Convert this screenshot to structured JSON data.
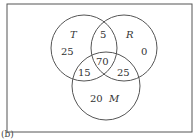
{
  "diagram": {
    "type": "venn",
    "caption": "(b)",
    "sets": {
      "T": {
        "label": "T",
        "only": "25"
      },
      "R": {
        "label": "R",
        "only": "0"
      },
      "M": {
        "label": "M",
        "only": "20"
      }
    },
    "regions": {
      "T_R": "5",
      "T_M": "15",
      "R_M": "25",
      "T_R_M": "70"
    },
    "colors": {
      "line": "#555555",
      "text": "#333333"
    }
  }
}
